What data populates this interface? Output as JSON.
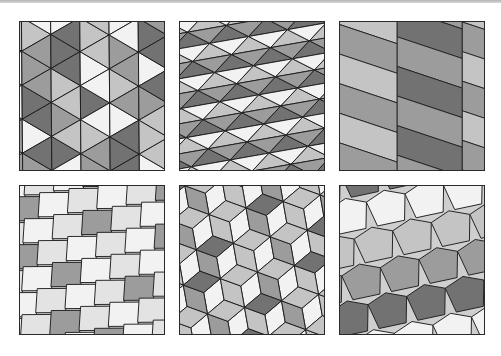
{
  "figure": {
    "panels": [
      {
        "id": "a",
        "label": "twisted-triangle tiling",
        "row": 0,
        "col": 0,
        "x": 19,
        "y": 21,
        "style": "triangles",
        "rotate": -30
      },
      {
        "id": "b",
        "label": "triangle band tiling",
        "row": 0,
        "col": 1,
        "x": 179,
        "y": 21,
        "style": "bands",
        "rotate": -10
      },
      {
        "id": "c",
        "label": "parallelogram strip tiling",
        "row": 0,
        "col": 2,
        "x": 339,
        "y": 21,
        "style": "strips",
        "rotate": 0
      },
      {
        "id": "d",
        "label": "quadrilateral brick tiling",
        "row": 1,
        "col": 0,
        "x": 19,
        "y": 185,
        "style": "bricks",
        "rotate": -8
      },
      {
        "id": "e",
        "label": "rhombus star tiling",
        "row": 1,
        "col": 1,
        "x": 179,
        "y": 185,
        "style": "rhombi",
        "rotate": -10
      },
      {
        "id": "f",
        "label": "pentagonal tiling",
        "row": 1,
        "col": 2,
        "x": 339,
        "y": 185,
        "style": "pentagons",
        "rotate": -12
      }
    ]
  },
  "palette": {
    "white": "#f2f2f2",
    "light": "#c4c4c4",
    "mid": "#9c9c9c",
    "dark": "#727272",
    "line": "#1e1e1e",
    "border": "#2a2a2a"
  }
}
